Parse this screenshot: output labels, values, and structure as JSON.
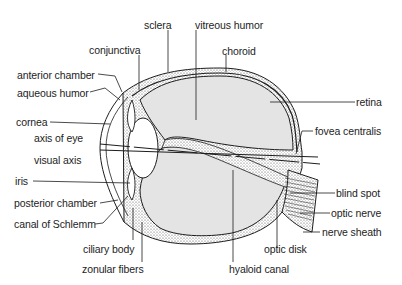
{
  "diagram": {
    "colors": {
      "background": "#ffffff",
      "line": "#1d1d1d",
      "vitreous_fill": "#e4e4e4",
      "stipple_fill": "#cfcfcf"
    },
    "labels": {
      "sclera": "sclera",
      "vitreous_humor": "vitreous humor",
      "conjunctiva": "conjunctiva",
      "choroid": "choroid",
      "anterior_chamber": "anterior chamber",
      "aqueous_humor": "aqueous humor",
      "retina": "retina",
      "cornea": "cornea",
      "fovea_centralis": "fovea centralis",
      "axis_of_eye": "axis of eye",
      "visual_axis": "visual axis",
      "iris": "iris",
      "blind_spot": "blind spot",
      "posterior_chamber": "posterior chamber",
      "optic_nerve": "optic nerve",
      "canal_of_schlemm": "canal of Schlemm",
      "nerve_sheath": "nerve sheath",
      "ciliary_body": "ciliary body",
      "optic_disk": "optic disk",
      "zonular_fibers": "zonular fibers",
      "hyaloid_canal": "hyaloid canal"
    }
  }
}
